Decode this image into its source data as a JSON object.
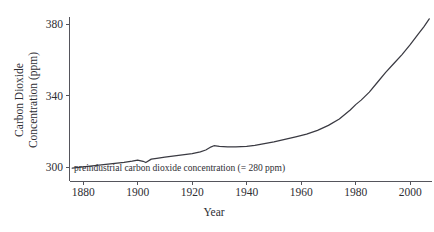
{
  "chart_data": {
    "type": "line",
    "title": "",
    "xlabel": "Year",
    "ylabel_line1": "Carbon Dioxide",
    "ylabel_line2": "Concentration (ppm)",
    "xlim": [
      1875,
      2008
    ],
    "ylim": [
      292,
      384
    ],
    "grid": false,
    "legend": "none",
    "xticks": [
      1880,
      1900,
      1920,
      1940,
      1960,
      1980,
      2000
    ],
    "xtick_labels": [
      "1880",
      "1900",
      "1920",
      "1940",
      "1960",
      "1980",
      "2000"
    ],
    "yticks": [
      300,
      340,
      380
    ],
    "ytick_labels": [
      "300",
      "340",
      "380"
    ],
    "annotation": "preindustrial carbon dioxide concentration (= 280 ppm)",
    "series": [
      {
        "name": "Atmospheric CO2 concentration",
        "color": "#3a3a42",
        "x": [
          1876,
          1880,
          1885,
          1890,
          1895,
          1898,
          1900,
          1902,
          1903,
          1905,
          1907,
          1910,
          1915,
          1920,
          1923,
          1925,
          1927,
          1928,
          1930,
          1933,
          1936,
          1940,
          1943,
          1946,
          1950,
          1954,
          1958,
          1962,
          1966,
          1970,
          1974,
          1978,
          1980,
          1982,
          1985,
          1988,
          1991,
          1994,
          1997,
          2000,
          2003,
          2005,
          2007
        ],
        "y": [
          299.5,
          300.2,
          301.0,
          301.8,
          302.7,
          303.4,
          304.0,
          303.3,
          302.6,
          304.5,
          305.0,
          305.6,
          306.6,
          307.6,
          308.6,
          309.6,
          311.4,
          312.0,
          311.6,
          311.3,
          311.4,
          311.6,
          312.2,
          313.0,
          314.2,
          315.6,
          317.0,
          318.5,
          320.6,
          323.4,
          327.0,
          332.0,
          335.0,
          337.5,
          342.0,
          347.5,
          353.0,
          358.0,
          363.0,
          368.5,
          374.5,
          378.5,
          383.0
        ]
      }
    ]
  }
}
